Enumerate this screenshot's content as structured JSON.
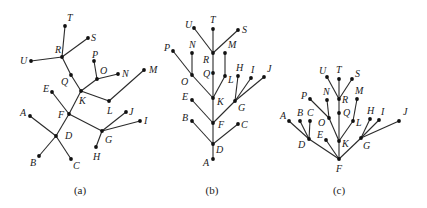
{
  "figure": {
    "edges": [
      [
        "R",
        "T"
      ],
      [
        "R",
        "S"
      ],
      [
        "R",
        "U"
      ],
      [
        "R",
        "Q"
      ],
      [
        "Q",
        "K"
      ],
      [
        "K",
        "O"
      ],
      [
        "O",
        "P"
      ],
      [
        "O",
        "N"
      ],
      [
        "K",
        "L"
      ],
      [
        "L",
        "M"
      ],
      [
        "K",
        "F"
      ],
      [
        "F",
        "E"
      ],
      [
        "F",
        "D"
      ],
      [
        "D",
        "A"
      ],
      [
        "D",
        "B"
      ],
      [
        "D",
        "C"
      ],
      [
        "F",
        "G"
      ],
      [
        "G",
        "H"
      ],
      [
        "G",
        "I"
      ],
      [
        "G",
        "J"
      ]
    ],
    "panels": [
      {
        "caption": "(a)",
        "caption_pos": [
          80,
          194
        ],
        "nodes": {
          "T": {
            "x": 65,
            "y": 26,
            "lx": 2,
            "ly": -5
          },
          "S": {
            "x": 88,
            "y": 38,
            "lx": 3,
            "ly": 3
          },
          "R": {
            "x": 62,
            "y": 57,
            "lx": -7,
            "ly": -4
          },
          "U": {
            "x": 31,
            "y": 61,
            "lx": -11,
            "ly": 3
          },
          "Q": {
            "x": 71,
            "y": 75,
            "lx": -10,
            "ly": 10
          },
          "P": {
            "x": 94,
            "y": 61,
            "lx": -2,
            "ly": -3
          },
          "O": {
            "x": 97,
            "y": 79,
            "lx": 3,
            "ly": -5
          },
          "N": {
            "x": 118,
            "y": 74,
            "lx": 4,
            "ly": 3
          },
          "M": {
            "x": 144,
            "y": 70,
            "lx": 5,
            "ly": 3
          },
          "K": {
            "x": 81,
            "y": 91,
            "lx": -2,
            "ly": 13
          },
          "L": {
            "x": 109,
            "y": 101,
            "lx": -2,
            "ly": 13
          },
          "E": {
            "x": 52,
            "y": 92,
            "lx": -9,
            "ly": 0
          },
          "F": {
            "x": 69,
            "y": 114,
            "lx": -11,
            "ly": 4
          },
          "A": {
            "x": 30,
            "y": 116,
            "lx": -10,
            "ly": 0
          },
          "J": {
            "x": 126,
            "y": 112,
            "lx": 3,
            "ly": 3
          },
          "I": {
            "x": 140,
            "y": 121,
            "lx": 4,
            "ly": 3
          },
          "G": {
            "x": 102,
            "y": 131,
            "lx": 3,
            "ly": 12
          },
          "D": {
            "x": 56,
            "y": 136,
            "lx": 9,
            "ly": 3
          },
          "H": {
            "x": 96,
            "y": 147,
            "lx": -3,
            "ly": 13
          },
          "B": {
            "x": 39,
            "y": 156,
            "lx": -9,
            "ly": 10
          },
          "C": {
            "x": 71,
            "y": 159,
            "lx": 2,
            "ly": 10
          }
        }
      },
      {
        "caption": "(b)",
        "caption_pos": [
          212,
          194
        ],
        "nodes": {
          "U": {
            "x": 194,
            "y": 28,
            "lx": -9,
            "ly": 0
          },
          "T": {
            "x": 213,
            "y": 29,
            "lx": -3,
            "ly": -6
          },
          "S": {
            "x": 238,
            "y": 30,
            "lx": 4,
            "ly": 3
          },
          "R": {
            "x": 213,
            "y": 53,
            "lx": -10,
            "ly": 10
          },
          "P": {
            "x": 173,
            "y": 51,
            "lx": -9,
            "ly": 0
          },
          "N": {
            "x": 192,
            "y": 53,
            "lx": -3,
            "ly": -5
          },
          "M": {
            "x": 225,
            "y": 53,
            "lx": 3,
            "ly": -5
          },
          "O": {
            "x": 192,
            "y": 75,
            "lx": -11,
            "ly": 10
          },
          "Q": {
            "x": 213,
            "y": 73,
            "lx": -10,
            "ly": 4
          },
          "L": {
            "x": 225,
            "y": 76,
            "lx": 3,
            "ly": 7
          },
          "H": {
            "x": 238,
            "y": 76,
            "lx": -2,
            "ly": -5
          },
          "I": {
            "x": 251,
            "y": 78,
            "lx": 0,
            "ly": -5
          },
          "J": {
            "x": 264,
            "y": 77,
            "lx": 3,
            "ly": -5
          },
          "K": {
            "x": 213,
            "y": 98,
            "lx": 4,
            "ly": 7
          },
          "E": {
            "x": 192,
            "y": 100,
            "lx": -10,
            "ly": 0
          },
          "G": {
            "x": 235,
            "y": 101,
            "lx": 3,
            "ly": 10
          },
          "B": {
            "x": 192,
            "y": 121,
            "lx": -10,
            "ly": 0
          },
          "F": {
            "x": 213,
            "y": 123,
            "lx": 5,
            "ly": 5
          },
          "C": {
            "x": 238,
            "y": 124,
            "lx": 3,
            "ly": 4
          },
          "D": {
            "x": 213,
            "y": 144,
            "lx": 3,
            "ly": 9
          },
          "A": {
            "x": 213,
            "y": 159,
            "lx": -10,
            "ly": 7
          }
        }
      },
      {
        "caption": "(c)",
        "caption_pos": [
          339,
          194
        ],
        "nodes": {
          "U": {
            "x": 327,
            "y": 77,
            "lx": -8,
            "ly": -3
          },
          "T": {
            "x": 339,
            "y": 79,
            "lx": -3,
            "ly": -6
          },
          "S": {
            "x": 352,
            "y": 79,
            "lx": 3,
            "ly": -2
          },
          "R": {
            "x": 339,
            "y": 99,
            "lx": 3,
            "ly": 4
          },
          "P": {
            "x": 310,
            "y": 99,
            "lx": -9,
            "ly": 0
          },
          "N": {
            "x": 327,
            "y": 100,
            "lx": -4,
            "ly": -5
          },
          "M": {
            "x": 357,
            "y": 99,
            "lx": -2,
            "ly": -5
          },
          "O": {
            "x": 329,
            "y": 118,
            "lx": -11,
            "ly": 8
          },
          "Q": {
            "x": 339,
            "y": 113,
            "lx": 4,
            "ly": 3
          },
          "L": {
            "x": 353,
            "y": 121,
            "lx": 3,
            "ly": 5
          },
          "H": {
            "x": 370,
            "y": 119,
            "lx": -3,
            "ly": -5
          },
          "I": {
            "x": 379,
            "y": 120,
            "lx": 2,
            "ly": -5
          },
          "J": {
            "x": 399,
            "y": 121,
            "lx": 4,
            "ly": -6
          },
          "A": {
            "x": 289,
            "y": 121,
            "lx": -9,
            "ly": -2
          },
          "B": {
            "x": 300,
            "y": 121,
            "lx": -3,
            "ly": -5
          },
          "C": {
            "x": 310,
            "y": 121,
            "lx": -3,
            "ly": -5
          },
          "D": {
            "x": 309,
            "y": 139,
            "lx": -11,
            "ly": 9
          },
          "E": {
            "x": 326,
            "y": 140,
            "lx": -9,
            "ly": -2
          },
          "K": {
            "x": 339,
            "y": 141,
            "lx": 3,
            "ly": 6
          },
          "G": {
            "x": 361,
            "y": 138,
            "lx": 2,
            "ly": 11
          },
          "F": {
            "x": 339,
            "y": 159,
            "lx": -3,
            "ly": 13
          }
        }
      }
    ]
  }
}
